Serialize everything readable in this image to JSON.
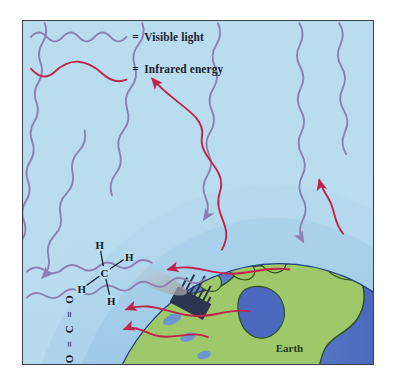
{
  "figure": {
    "background_color": "#b9dcef",
    "border_color": "#3a3f4a"
  },
  "legend": {
    "items": [
      {
        "id": "visible-light",
        "equals_sign": "=",
        "label": "Visible light",
        "wave_color": "#8f7fb0",
        "wave_type": "tight-sine"
      },
      {
        "id": "infrared-energy",
        "equals_sign": "=",
        "label": "Infrared energy",
        "wave_color": "#c0244a",
        "wave_type": "long-sine"
      }
    ]
  },
  "earth": {
    "label": "Earth",
    "ocean_color": "#3b5bb0",
    "land_color": "#9dc96a",
    "land_outline_color": "#2f4f1f",
    "lake_color": "#6f94cf",
    "continent": "North America"
  },
  "atmosphere": {
    "band_colors": [
      "#a8cfe8",
      "#9cc6e4",
      "#8dbce0"
    ],
    "description": "Layered atmospheric arcs above Earth"
  },
  "molecules": [
    {
      "id": "methane",
      "formula": "CH4",
      "center_atom": "C",
      "outer_atoms": [
        "H",
        "H",
        "H",
        "H"
      ],
      "rotation_deg": -68
    },
    {
      "id": "carbon-dioxide",
      "formula": "O=C=O",
      "atoms": [
        "O",
        "C",
        "O"
      ],
      "bond_symbol": "=",
      "rotation_deg": -90
    }
  ],
  "city": {
    "id": "city-skyline",
    "color": "#2b3550",
    "smoke_color": "#b9b9b9",
    "description": "Industrial skyline emitting smoke plume"
  },
  "rays": {
    "visible_incoming_count": 6,
    "infrared_outgoing_count": 2,
    "infrared_trapped_count": 3,
    "visible_color": "#8f7fb0",
    "infrared_color": "#c0244a"
  }
}
